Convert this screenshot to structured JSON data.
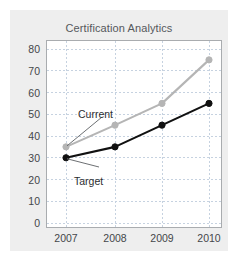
{
  "card": {
    "background_color": "#eeeeee"
  },
  "chart_data": {
    "type": "line",
    "title": "Certification Analytics",
    "xlabel": "",
    "ylabel": "",
    "categories": [
      "2007",
      "2008",
      "2009",
      "2010"
    ],
    "x": [
      2007,
      2008,
      2009,
      2010
    ],
    "ylim": [
      0,
      80
    ],
    "yticks": [
      "0",
      "10",
      "20",
      "30",
      "40",
      "50",
      "60",
      "70",
      "80"
    ],
    "ytick_values": [
      0,
      10,
      20,
      30,
      40,
      50,
      60,
      70,
      80
    ],
    "grid": true,
    "grid_style": "dashed",
    "grid_color": "#c6d2e0",
    "legend": "annotations",
    "series": [
      {
        "name": "Current",
        "color": "#b5b5b5",
        "marker": "circle",
        "values": [
          35,
          45,
          55,
          75
        ]
      },
      {
        "name": "Target",
        "color": "#111111",
        "marker": "circle",
        "values": [
          30,
          35,
          45,
          55
        ]
      }
    ],
    "annotations": [
      {
        "label": "Current",
        "points_to_series": "Current",
        "points_to_category": "2007"
      },
      {
        "label": "Target",
        "points_to_series": "Target",
        "points_to_category": "2007"
      }
    ]
  }
}
